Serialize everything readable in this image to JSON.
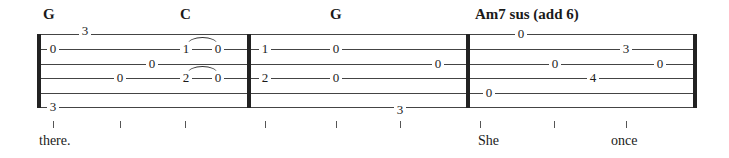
{
  "tablature": {
    "strings": 6,
    "chords": [
      {
        "label": "G",
        "x": 43
      },
      {
        "label": "C",
        "x": 180
      },
      {
        "label": "G",
        "x": 330
      },
      {
        "label": "Am7 sus (add 6)",
        "x": 475
      }
    ],
    "barlines": [
      {
        "x": 37,
        "thick": true
      },
      {
        "x": 247,
        "thick": true
      },
      {
        "x": 466,
        "thick": true
      },
      {
        "x": 693,
        "thick": true
      }
    ],
    "notes": [
      {
        "fret": "0",
        "string": 2,
        "x": 53
      },
      {
        "fret": "3",
        "string": 1,
        "x": 85,
        "y_offset": -3
      },
      {
        "fret": "3",
        "string": 6,
        "x": 53
      },
      {
        "fret": "0",
        "string": 4,
        "x": 120
      },
      {
        "fret": "0",
        "string": 3,
        "x": 152
      },
      {
        "fret": "1",
        "string": 2,
        "x": 186
      },
      {
        "fret": "0",
        "string": 2,
        "x": 218
      },
      {
        "fret": "2",
        "string": 4,
        "x": 186
      },
      {
        "fret": "0",
        "string": 4,
        "x": 218
      },
      {
        "fret": "1",
        "string": 2,
        "x": 265
      },
      {
        "fret": "2",
        "string": 4,
        "x": 265
      },
      {
        "fret": "0",
        "string": 2,
        "x": 336
      },
      {
        "fret": "0",
        "string": 4,
        "x": 336
      },
      {
        "fret": "0",
        "string": 3,
        "x": 438
      },
      {
        "fret": "3",
        "string": 6,
        "x": 400,
        "y_offset": 3
      },
      {
        "fret": "0",
        "string": 5,
        "x": 489
      },
      {
        "fret": "0",
        "string": 1,
        "x": 521
      },
      {
        "fret": "0",
        "string": 3,
        "x": 555
      },
      {
        "fret": "4",
        "string": 4,
        "x": 593
      },
      {
        "fret": "3",
        "string": 2,
        "x": 626
      },
      {
        "fret": "0",
        "string": 3,
        "x": 660
      }
    ],
    "slurs": [
      {
        "from_x": 188,
        "to_x": 217,
        "string": 2
      },
      {
        "from_x": 188,
        "to_x": 217,
        "string": 4
      }
    ],
    "ticks": [
      53,
      120,
      185,
      265,
      336,
      400,
      480,
      554,
      626
    ],
    "lyrics": [
      {
        "text": "there.",
        "x": 39
      },
      {
        "text": "She",
        "x": 478
      },
      {
        "text": "once",
        "x": 611
      }
    ]
  }
}
